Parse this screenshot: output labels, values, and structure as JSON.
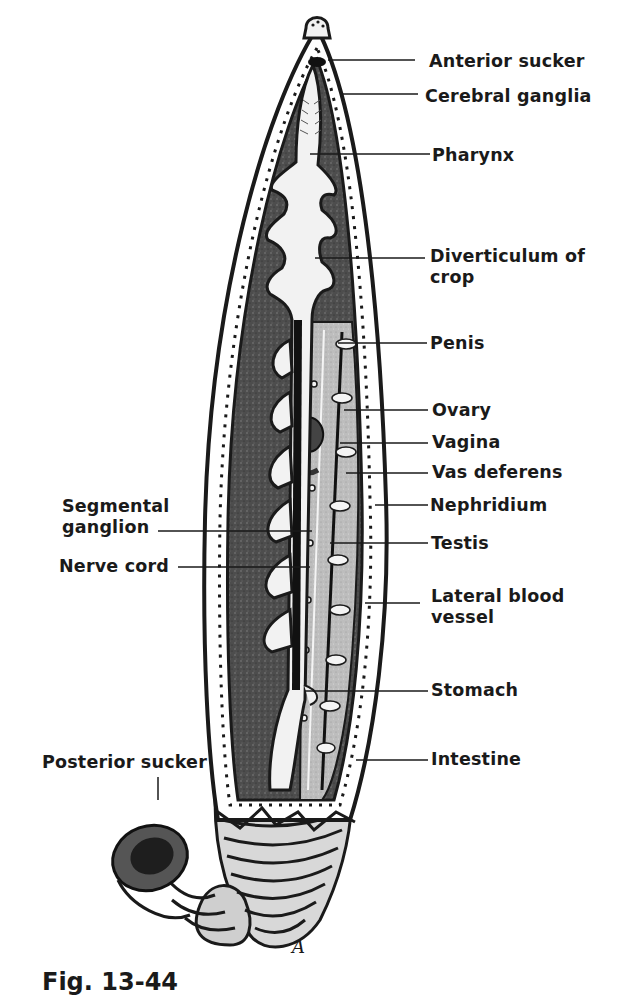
{
  "figure": {
    "caption": "Fig. 13-44",
    "artist_mark": "A",
    "colors": {
      "ink": "#1a1a1a",
      "stipple_dark": "#4a4a4a",
      "mid_gray": "#9a9a9a",
      "light_gray": "#cfcfcf",
      "paper": "#ffffff"
    }
  },
  "labels": {
    "right": [
      {
        "id": "anterior-sucker",
        "text": "Anterior sucker"
      },
      {
        "id": "cerebral-ganglia",
        "text": "Cerebral ganglia"
      },
      {
        "id": "pharynx",
        "text": "Pharynx"
      },
      {
        "id": "diverticulum-of-crop",
        "line1": "Diverticulum of",
        "line2": "crop"
      },
      {
        "id": "penis",
        "text": "Penis"
      },
      {
        "id": "ovary",
        "text": "Ovary"
      },
      {
        "id": "vagina",
        "text": "Vagina"
      },
      {
        "id": "vas-deferens",
        "text": "Vas deferens"
      },
      {
        "id": "nephridium",
        "text": "Nephridium"
      },
      {
        "id": "testis",
        "text": "Testis"
      },
      {
        "id": "lateral-blood-vessel",
        "line1": "Lateral blood",
        "line2": "vessel"
      },
      {
        "id": "stomach",
        "text": "Stomach"
      },
      {
        "id": "intestine",
        "text": "Intestine"
      }
    ],
    "left": [
      {
        "id": "segmental-ganglion",
        "line1": "Segmental",
        "line2": "ganglion"
      },
      {
        "id": "nerve-cord",
        "text": "Nerve cord"
      },
      {
        "id": "posterior-sucker",
        "text": "Posterior sucker"
      }
    ]
  }
}
